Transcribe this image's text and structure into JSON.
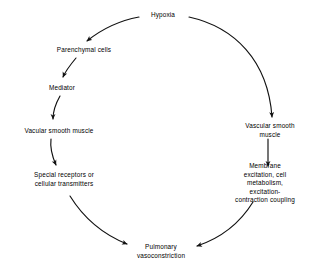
{
  "diagram": {
    "type": "cycle-flowchart",
    "background_color": "#ffffff",
    "stroke_color": "#000000",
    "text_color": "#000000",
    "nodes": [
      {
        "id": "hypoxia",
        "label": "Hypoxia",
        "x": 163,
        "y": 15
      },
      {
        "id": "parenchymal",
        "label": "Parenchymal cells",
        "x": 84,
        "y": 50
      },
      {
        "id": "mediator",
        "label": "Mediator",
        "x": 62,
        "y": 88
      },
      {
        "id": "vsm-left",
        "label": "Vacular smooth muscle",
        "x": 59,
        "y": 131
      },
      {
        "id": "receptors",
        "label": "Special receptors or\ncellular transmitters",
        "x": 64,
        "y": 180
      },
      {
        "id": "vsm-right",
        "label": "Vascular smooth muscle",
        "x": 270,
        "y": 131
      },
      {
        "id": "membrane",
        "label": "Membrane excitation, cell\nmetabolism, excitation-\ncontraction coupling",
        "x": 265,
        "y": 183
      },
      {
        "id": "vasoconstrict",
        "label": "Pulmonary\nvasoconstriction",
        "x": 161,
        "y": 252
      }
    ],
    "edges": [
      {
        "id": "hypoxia-to-parenchymal",
        "from": "hypoxia",
        "to": "parenchymal",
        "shape": "curve-left-down"
      },
      {
        "id": "hypoxia-to-vsm-right",
        "from": "hypoxia",
        "to": "vsm-right",
        "shape": "arc-right-down"
      },
      {
        "id": "parenchymal-to-mediator",
        "from": "parenchymal",
        "to": "mediator",
        "shape": "short-diagonal-down"
      },
      {
        "id": "mediator-to-vsm-left",
        "from": "mediator",
        "to": "vsm-left",
        "shape": "short-curve-down"
      },
      {
        "id": "vsm-left-to-receptors",
        "from": "vsm-left",
        "to": "receptors",
        "shape": "short-curve-down"
      },
      {
        "id": "receptors-to-vaso",
        "from": "receptors",
        "to": "vasoconstrict",
        "shape": "long-curve-down-right"
      },
      {
        "id": "vsm-right-to-membrane",
        "from": "vsm-right",
        "to": "membrane",
        "shape": "short-vertical-down"
      },
      {
        "id": "membrane-to-vaso",
        "from": "membrane",
        "to": "vasoconstrict",
        "shape": "long-curve-down-left"
      }
    ]
  }
}
